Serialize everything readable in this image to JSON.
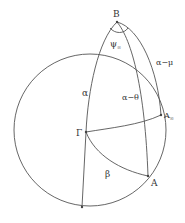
{
  "diagram": {
    "type": "spherical-triangle-diagram",
    "points": {
      "B": {
        "label": "B",
        "x": 117,
        "y": 22
      },
      "Gamma": {
        "label": "Γ",
        "x": 86,
        "y": 132
      },
      "A_inf": {
        "label": "A",
        "subscript": "∞",
        "x": 161,
        "y": 115
      },
      "A": {
        "label": "A",
        "x": 148,
        "y": 176
      },
      "bottom": {
        "label": "",
        "x": 82,
        "y": 207
      }
    },
    "arc_labels": {
      "alpha": "α",
      "alpha_minus_theta": "α−θ",
      "alpha_minus_mu": "α−μ",
      "beta": "β",
      "psi_inf": "ψ",
      "psi_inf_sub": "∞"
    },
    "colors": {
      "stroke": "#555555",
      "text": "#333333",
      "background": "#ffffff"
    }
  }
}
